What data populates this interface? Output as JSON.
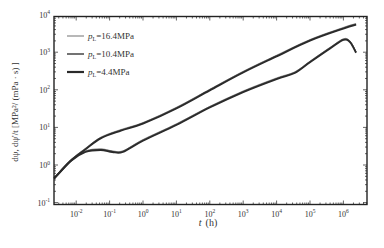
{
  "chart_data": {
    "type": "line",
    "title": "",
    "xlabel": "t (h)",
    "ylabel": "dψ, dψ'/t [MPa²/(mPa·s)]",
    "xscale": "log",
    "yscale": "log",
    "xlim": [
      0.0022,
      5000000
    ],
    "ylim": [
      0.1,
      10000
    ],
    "x_ticks": [
      "10^-2",
      "10^-1",
      "10^0",
      "10^1",
      "10^2",
      "10^3",
      "10^4",
      "10^5",
      "10^6"
    ],
    "y_ticks": [
      "10^-1",
      "10^0",
      "10^1",
      "10^2",
      "10^3",
      "10^4"
    ],
    "grid": false,
    "legend_position": "upper left",
    "legend": [
      "pL=16.4MPa",
      "pL=10.4MPa",
      "pL=4.4MPa"
    ],
    "series": [
      {
        "name": "pL=16.4MPa",
        "color": "#9a9a9a",
        "width": 1,
        "pressure": {
          "x": [
            0.0022,
            0.0067,
            0.019,
            0.054,
            0.22,
            1,
            10,
            100,
            1000,
            10000,
            100000,
            1000000,
            2400000
          ],
          "y": [
            0.45,
            1.3,
            2.7,
            5.3,
            8.5,
            13,
            33,
            100,
            300,
            800,
            2100,
            4400,
            5600
          ]
        },
        "derivative": {
          "x": [
            0.0022,
            0.0067,
            0.019,
            0.054,
            0.12,
            0.25,
            1,
            10,
            100,
            1000,
            10000,
            35000,
            100000,
            400000,
            1000000,
            1600000,
            2400000
          ],
          "y": [
            0.45,
            1.3,
            2.3,
            2.6,
            2.3,
            2.3,
            4.6,
            12,
            35,
            90,
            200,
            290,
            560,
            1300,
            2200,
            1900,
            1000
          ]
        }
      },
      {
        "name": "pL=10.4MPa",
        "color": "#5a5a5a",
        "width": 1.3,
        "pressure": {
          "x": [
            0.0022,
            0.0067,
            0.019,
            0.054,
            0.22,
            1,
            10,
            100,
            1000,
            10000,
            100000,
            1000000,
            2400000
          ],
          "y": [
            0.45,
            1.3,
            2.7,
            5.3,
            8.5,
            13,
            33,
            100,
            300,
            800,
            2100,
            4400,
            5600
          ]
        },
        "derivative": {
          "x": [
            0.0022,
            0.0067,
            0.019,
            0.054,
            0.12,
            0.25,
            1,
            10,
            100,
            1000,
            10000,
            35000,
            100000,
            400000,
            1000000,
            1600000,
            2400000
          ],
          "y": [
            0.45,
            1.3,
            2.3,
            2.6,
            2.3,
            2.3,
            4.6,
            12,
            35,
            90,
            200,
            290,
            560,
            1300,
            2200,
            1900,
            1000
          ]
        }
      },
      {
        "name": "pL=4.4MPa",
        "color": "#2a2a2a",
        "width": 1.8,
        "pressure": {
          "x": [
            0.0022,
            0.0067,
            0.019,
            0.054,
            0.22,
            1,
            10,
            100,
            1000,
            10000,
            100000,
            1000000,
            2400000
          ],
          "y": [
            0.45,
            1.3,
            2.7,
            5.3,
            8.5,
            13,
            33,
            100,
            300,
            800,
            2100,
            4400,
            5600
          ]
        },
        "derivative": {
          "x": [
            0.0022,
            0.0067,
            0.019,
            0.054,
            0.12,
            0.25,
            1,
            10,
            100,
            1000,
            10000,
            35000,
            100000,
            400000,
            1000000,
            1600000,
            2400000
          ],
          "y": [
            0.45,
            1.3,
            2.3,
            2.6,
            2.3,
            2.3,
            4.6,
            12,
            35,
            90,
            200,
            290,
            560,
            1300,
            2200,
            1900,
            1000
          ]
        }
      }
    ]
  },
  "axes": {
    "x_label_var": "t",
    "x_label_unit": "(h)",
    "y_label_text": "dψ,  dψ'/t [MPa²/ (mPa · s) ]"
  },
  "legend": {
    "items": [
      {
        "var": "p",
        "sub": "L",
        "value": "=16.4MPa"
      },
      {
        "var": "p",
        "sub": "L",
        "value": "=10.4MPa"
      },
      {
        "var": "p",
        "sub": "L",
        "value": "=4.4MPa"
      }
    ]
  }
}
